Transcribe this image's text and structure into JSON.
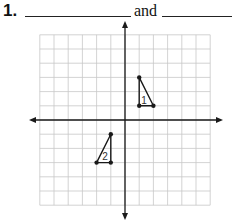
{
  "problem": {
    "number": "1.",
    "connector": "and",
    "blanks": [
      "",
      ""
    ]
  },
  "graph": {
    "grid_columns": 12,
    "grid_rows": 12,
    "x_range": [
      -6,
      6
    ],
    "y_range": [
      -6,
      6
    ],
    "axes": {
      "x_axis": true,
      "y_axis": true,
      "arrows": true
    },
    "colors": {
      "grid": "#c8c8c8",
      "axis": "#1a1a1a",
      "figure": "#1a1a1a"
    },
    "triangles": [
      {
        "label": "1",
        "vertices": [
          [
            1,
            3
          ],
          [
            1,
            1
          ],
          [
            2,
            1
          ]
        ]
      },
      {
        "label": "2",
        "vertices": [
          [
            -1,
            -1
          ],
          [
            -2,
            -3
          ],
          [
            -1,
            -3
          ]
        ]
      }
    ]
  }
}
